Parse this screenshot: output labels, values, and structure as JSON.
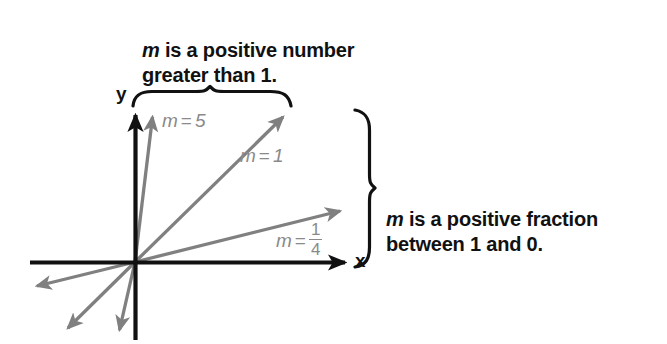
{
  "figure": {
    "kind": "coordinate-plane-slope-illustration",
    "axis_labels": {
      "x": "x",
      "y": "y"
    },
    "colors": {
      "axis": "#111111",
      "ray": "#808080",
      "brace": "#111111",
      "label_text": "#111111",
      "slope_label": "#8a8a8a",
      "background": "#ffffff"
    },
    "callouts": [
      {
        "id": "top",
        "var": "m",
        "text": " is a positive number\ngreater than 1.",
        "full_text": "m is a positive number greater than 1.",
        "brace": "horizontal-top"
      },
      {
        "id": "right",
        "var": "m",
        "text": " is a positive fraction\nbetween 1 and 0.",
        "full_text": "m is a positive fraction between 1 and 0.",
        "brace": "vertical-right"
      }
    ],
    "rays": [
      {
        "id": "m5",
        "var": "m",
        "eq": "=",
        "value": "5",
        "slope": 5,
        "label": "m = 5"
      },
      {
        "id": "m1",
        "var": "m",
        "eq": "=",
        "value": "1",
        "slope": 1,
        "label": "m = 1"
      },
      {
        "id": "mquarter",
        "var": "m",
        "eq": "=",
        "numerator": "1",
        "denominator": "4",
        "slope": 0.25,
        "label": "m = 1/4"
      }
    ]
  }
}
